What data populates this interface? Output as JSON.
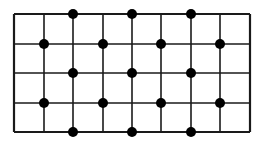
{
  "diagram": {
    "type": "grid-with-dots",
    "columns": 8,
    "rows": 4,
    "grid": {
      "x_lines": [
        14,
        44,
        73,
        103,
        132,
        161,
        191,
        220,
        250
      ],
      "y_lines": [
        14,
        44,
        73,
        103,
        132
      ],
      "stroke": "#1a1a1a"
    },
    "dots": [
      {
        "x": 73,
        "y": 14
      },
      {
        "x": 132,
        "y": 14
      },
      {
        "x": 191,
        "y": 14
      },
      {
        "x": 44,
        "y": 44
      },
      {
        "x": 103,
        "y": 44
      },
      {
        "x": 161,
        "y": 44
      },
      {
        "x": 220,
        "y": 44
      },
      {
        "x": 73,
        "y": 73
      },
      {
        "x": 132,
        "y": 73
      },
      {
        "x": 191,
        "y": 73
      },
      {
        "x": 44,
        "y": 103
      },
      {
        "x": 103,
        "y": 103
      },
      {
        "x": 161,
        "y": 103
      },
      {
        "x": 220,
        "y": 103
      },
      {
        "x": 73,
        "y": 132
      },
      {
        "x": 132,
        "y": 132
      },
      {
        "x": 191,
        "y": 132
      }
    ],
    "dot_radius": 5,
    "dot_color": "#000000"
  }
}
